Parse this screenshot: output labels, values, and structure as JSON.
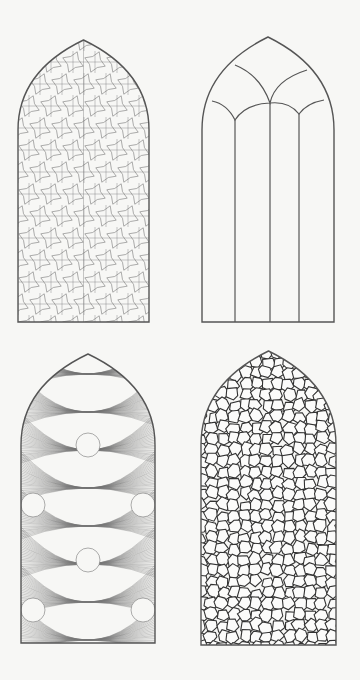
{
  "figure": {
    "background": "#f7f7f5",
    "stroke_color": "#555555",
    "panels": [
      {
        "id": "geometric-tracery",
        "position": "top-left",
        "pattern": "islamic-star-lattice",
        "bounds": {
          "x": 18,
          "y": 40,
          "w": 131,
          "h": 282
        },
        "springline_y": 130
      },
      {
        "id": "gothic-lancet-outline",
        "position": "top-right",
        "pattern": "gothic-mullions",
        "bounds": {
          "x": 202,
          "y": 37,
          "w": 132,
          "h": 285
        },
        "springline_y": 130,
        "mullions_x": [
          235,
          270,
          299
        ]
      },
      {
        "id": "interlaced-star-tracery",
        "position": "bottom-left",
        "pattern": "interlaced-girih",
        "bounds": {
          "x": 21,
          "y": 354,
          "w": 134,
          "h": 289
        },
        "springline_y": 445
      },
      {
        "id": "voronoi-stained-glass",
        "position": "bottom-right",
        "pattern": "voronoi-cells",
        "bounds": {
          "x": 201,
          "y": 351,
          "w": 135,
          "h": 294
        },
        "springline_y": 445
      }
    ]
  }
}
